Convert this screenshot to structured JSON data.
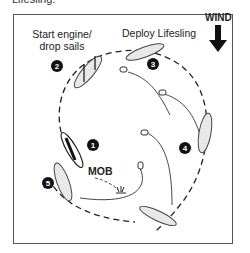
{
  "caption_cutoff": "Lifesling.",
  "labels": {
    "start_engine": "Start engine/",
    "drop_sails": "drop sails",
    "deploy": "Deploy Lifesling",
    "wind": "WIND",
    "mob": "MOB"
  },
  "steps": [
    "1",
    "2",
    "3",
    "4",
    "5"
  ],
  "colors": {
    "line": "#222222",
    "boat_fill": "#e8e8e8",
    "badge": "#111111"
  }
}
